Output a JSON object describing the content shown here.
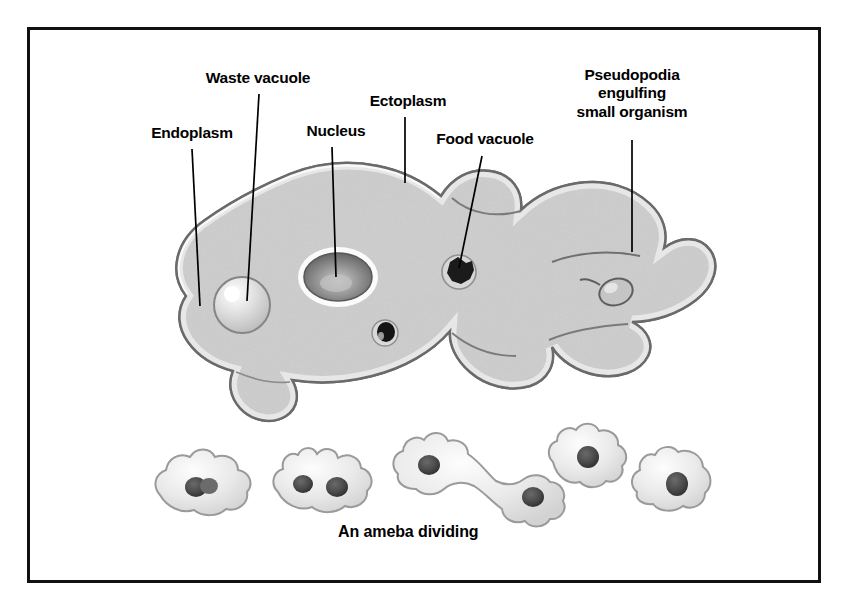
{
  "figure": {
    "title_caption": "An ameba dividing",
    "background_color": "#ffffff",
    "frame_color": "#111111",
    "labels": [
      {
        "id": "endoplasm",
        "text": "Endoplasm",
        "x": 138,
        "y": 124,
        "width": 108,
        "leader": {
          "x1": 192,
          "y1": 149,
          "x2": 200,
          "y2": 306
        }
      },
      {
        "id": "waste-vacuole",
        "text": "Waste vacuole",
        "x": 192,
        "y": 69,
        "width": 132,
        "leader": {
          "x1": 259,
          "y1": 94,
          "x2": 247,
          "y2": 301
        }
      },
      {
        "id": "nucleus",
        "text": "Nucleus",
        "x": 296,
        "y": 122,
        "width": 80,
        "leader": {
          "x1": 332,
          "y1": 147,
          "x2": 336,
          "y2": 277
        }
      },
      {
        "id": "ectoplasm",
        "text": "Ectoplasm",
        "x": 358,
        "y": 92,
        "width": 100,
        "leader": {
          "x1": 405,
          "y1": 117,
          "x2": 405,
          "y2": 183
        }
      },
      {
        "id": "food-vacuole",
        "text": "Food vacuole",
        "x": 422,
        "y": 130,
        "width": 126,
        "leader": {
          "x1": 482,
          "y1": 156,
          "x2": 459,
          "y2": 268
        }
      },
      {
        "id": "pseudopodia",
        "text": "Pseudopodia\nengulfing\nsmall organism",
        "x": 556,
        "y": 66,
        "width": 152,
        "leader": {
          "x1": 632,
          "y1": 140,
          "x2": 632,
          "y2": 252
        }
      }
    ],
    "caption": {
      "text": "An ameba dividing",
      "x": 338,
      "y": 523
    },
    "structures": {
      "nucleus_label": "Nucleus",
      "waste_vacuole_label": "Waste vacuole",
      "food_vacuole_label": "Food vacuole",
      "ectoplasm_label": "Ectoplasm",
      "endoplasm_label": "Endoplasm",
      "pseudopodia_label": "Pseudopodia engulfing small organism"
    },
    "dividing_sequence": {
      "count": 5,
      "stage_labels": [
        "stage-1",
        "stage-2",
        "stage-3",
        "stage-4",
        "stage-5"
      ]
    }
  }
}
